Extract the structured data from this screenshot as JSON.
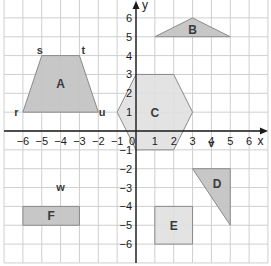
{
  "diagram": {
    "type": "coordinate-grid",
    "x_range": [
      -7,
      7
    ],
    "y_range": [
      -7,
      7
    ],
    "grid_extent": {
      "x_min": -7,
      "x_max": 7,
      "y_min": -7,
      "y_max": 7
    },
    "axis_labels": {
      "x": "x",
      "y": "y"
    },
    "x_ticks": [
      "−6",
      "−5",
      "−4",
      "−3",
      "−2",
      "−1",
      "0",
      "1",
      "2",
      "3",
      "4",
      "5",
      "6"
    ],
    "x_tick_values": [
      -6,
      -5,
      -4,
      -3,
      -2,
      -1,
      0,
      1,
      2,
      3,
      4,
      5,
      6
    ],
    "y_ticks": [
      "6",
      "5",
      "4",
      "3",
      "2",
      "1",
      "−1",
      "−2",
      "−3",
      "−4",
      "−5",
      "−6"
    ],
    "y_tick_values": [
      6,
      5,
      4,
      3,
      2,
      1,
      -1,
      -2,
      -3,
      -4,
      -5,
      -6
    ],
    "colors": {
      "grid": "#cfcfcf",
      "axis": "#1a1a1a",
      "shape_dark": "#c4c4c4",
      "shape_light": "#e0e0e0",
      "stroke": "#8a8a8a"
    },
    "shapes": [
      {
        "label": "A",
        "kind": "trapezoid",
        "points": [
          [
            -6,
            1
          ],
          [
            -5,
            4
          ],
          [
            -3,
            4
          ],
          [
            -2,
            1
          ]
        ],
        "label_pos": [
          -4,
          2.5
        ],
        "fill": "dark"
      },
      {
        "label": "B",
        "kind": "triangle",
        "points": [
          [
            1,
            5
          ],
          [
            3,
            6
          ],
          [
            5,
            5
          ]
        ],
        "label_pos": [
          3,
          5.4
        ],
        "fill": "dark"
      },
      {
        "label": "C",
        "kind": "hexagon",
        "points": [
          [
            -1,
            1
          ],
          [
            0,
            3
          ],
          [
            2,
            3
          ],
          [
            3,
            1
          ],
          [
            2,
            -1
          ],
          [
            0,
            -1
          ]
        ],
        "label_pos": [
          1,
          1
        ],
        "fill": "light"
      },
      {
        "label": "D",
        "kind": "triangle",
        "points": [
          [
            3,
            -2
          ],
          [
            5,
            -2
          ],
          [
            5,
            -5
          ]
        ],
        "label_pos": [
          4.3,
          -2.8
        ],
        "fill": "dark"
      },
      {
        "label": "E",
        "kind": "rectangle",
        "points": [
          [
            1,
            -4
          ],
          [
            3,
            -4
          ],
          [
            3,
            -6
          ],
          [
            1,
            -6
          ]
        ],
        "label_pos": [
          2,
          -5
        ],
        "fill": "light"
      },
      {
        "label": "F",
        "kind": "rectangle",
        "points": [
          [
            -6,
            -4
          ],
          [
            -3,
            -4
          ],
          [
            -3,
            -5
          ],
          [
            -6,
            -5
          ]
        ],
        "label_pos": [
          -4.5,
          -4.5
        ],
        "fill": "dark"
      }
    ],
    "point_labels": [
      {
        "text": "r",
        "pos": [
          -6.35,
          1
        ]
      },
      {
        "text": "s",
        "pos": [
          -5.1,
          4.3
        ]
      },
      {
        "text": "t",
        "pos": [
          -2.8,
          4.3
        ]
      },
      {
        "text": "u",
        "pos": [
          -1.8,
          1
        ]
      },
      {
        "text": "v",
        "pos": [
          4,
          -0.65
        ]
      },
      {
        "text": "w",
        "pos": [
          -4,
          -2.95
        ]
      }
    ]
  }
}
